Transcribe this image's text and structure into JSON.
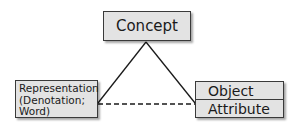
{
  "diagram": {
    "type": "semiotic-triangle",
    "nodes": {
      "concept": {
        "label": "Concept"
      },
      "representation": {
        "lines": [
          "Representation",
          "(Denotation;",
          "Word)"
        ]
      },
      "object_attribute": {
        "rows": [
          "Object",
          "Attribute"
        ]
      }
    },
    "edges": [
      {
        "from": "concept",
        "to": "representation",
        "style": "solid"
      },
      {
        "from": "concept",
        "to": "object_attribute",
        "style": "solid"
      },
      {
        "from": "representation",
        "to": "object_attribute",
        "style": "dashed"
      }
    ],
    "colors": {
      "box_fill": "#e3e3e3",
      "box_border": "#3a3a3a",
      "line": "#1a1a1a"
    }
  }
}
